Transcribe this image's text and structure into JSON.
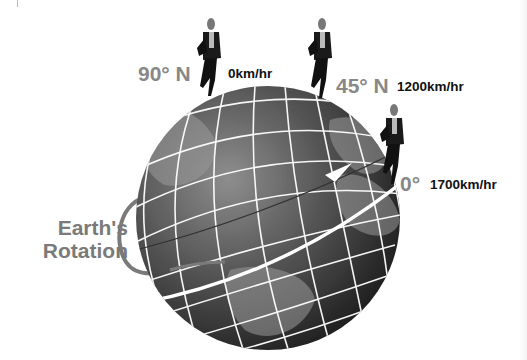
{
  "diagram": {
    "rotation_label": {
      "line1": "Earth's",
      "line2": "Rotation"
    },
    "markers": [
      {
        "latitude": "90° N",
        "speed": "0km/hr"
      },
      {
        "latitude": "45° N",
        "speed": "1200km/hr"
      },
      {
        "latitude": "0°",
        "speed": "1700km/hr"
      }
    ],
    "colors": {
      "latitude_text": "#888888",
      "speed_text": "#111111",
      "rotation_text": "#7a7a7a",
      "globe_dark": "#2a2a2a",
      "globe_light": "#8a8a8a",
      "grid_lines": "#ffffff"
    }
  }
}
